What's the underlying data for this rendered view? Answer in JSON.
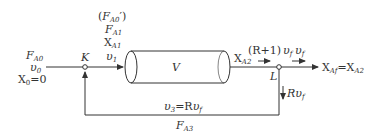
{
  "diagram": {
    "type": "recycle-reactor-flow",
    "colors": {
      "line": "#333333",
      "text": "#333333",
      "background": "#ffffff"
    },
    "feed": {
      "F": "F",
      "F_sub": "A0",
      "v": "υ",
      "v_sub": "0",
      "X": "X",
      "X_sub": "0",
      "X_val": "=0"
    },
    "mix_point": {
      "label": "K"
    },
    "reactor_inlet": {
      "paren_open": "(",
      "F_prime": "F",
      "F_prime_sub": "A0",
      "paren_close": "′)",
      "F": "F",
      "F_sub": "A1",
      "X": "X",
      "X_sub": "A1",
      "v": "υ",
      "v_sub": "1"
    },
    "reactor": {
      "label": "V"
    },
    "reactor_outlet": {
      "X": "X",
      "X_sub": "A2"
    },
    "split_point": {
      "label": "L"
    },
    "recycle_flow": {
      "pre": "(R+1)",
      "v": "υ",
      "v_sub": "f"
    },
    "product_flow": {
      "v": "υ",
      "v_sub": "f"
    },
    "product": {
      "X": "X",
      "X_sub": "Af",
      "eq": "=X",
      "eq_sub": "A2"
    },
    "recycle_down": {
      "R": "R",
      "v": "υ",
      "v_sub": "f"
    },
    "recycle_return": {
      "v": "υ",
      "v_sub": "3",
      "eq": "=R",
      "eq_v": "υ",
      "eq_v_sub": "f",
      "F": "F",
      "F_sub": "A3"
    }
  }
}
